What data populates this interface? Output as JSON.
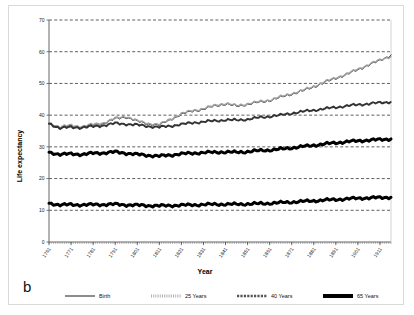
{
  "figure": {
    "panel_letter": "b",
    "frame_color": "#d9d9d9",
    "background": "#ffffff"
  },
  "chart_data": {
    "type": "line",
    "title": "",
    "xlabel": "Year",
    "ylabel": "Life expectancy",
    "xlim": [
      1761,
      1916
    ],
    "ylim": [
      0,
      70
    ],
    "ytick_step": 10,
    "yticks": [
      0,
      10,
      20,
      30,
      40,
      50,
      60,
      70
    ],
    "xticks": [
      1761,
      1771,
      1781,
      1791,
      1801,
      1811,
      1821,
      1831,
      1841,
      1851,
      1861,
      1871,
      1881,
      1891,
      1901,
      1911
    ],
    "grid": "horizontal-dashed",
    "legend_position": "bottom",
    "x": [
      1761,
      1766,
      1771,
      1776,
      1781,
      1786,
      1791,
      1796,
      1801,
      1806,
      1811,
      1816,
      1821,
      1826,
      1831,
      1836,
      1841,
      1846,
      1851,
      1856,
      1861,
      1866,
      1871,
      1876,
      1881,
      1886,
      1891,
      1896,
      1901,
      1906,
      1911,
      1916
    ],
    "series": [
      {
        "name": "Birth",
        "style": "thin-solid",
        "color": "#1a1a1a",
        "width": 1.0,
        "values": [
          37.4,
          36.1,
          36.6,
          36.2,
          36.9,
          37.4,
          38.8,
          39.4,
          38.0,
          37.2,
          36.8,
          38.6,
          40.2,
          41.3,
          41.8,
          42.9,
          43.5,
          42.8,
          43.4,
          44.0,
          44.6,
          45.6,
          46.6,
          47.6,
          48.9,
          50.3,
          51.6,
          52.8,
          54.3,
          55.8,
          57.2,
          59.0
        ],
        "end_value": 59.0
      },
      {
        "name": "25 Years",
        "style": "light-dotted",
        "color": "#9e9e9e",
        "width": 1.6,
        "values": [
          37.6,
          36.3,
          36.8,
          36.4,
          37.1,
          37.6,
          39.0,
          39.6,
          38.2,
          37.4,
          37.0,
          38.8,
          40.4,
          41.5,
          42.0,
          43.1,
          43.7,
          43.0,
          43.6,
          44.2,
          44.8,
          45.8,
          46.8,
          47.8,
          49.1,
          50.5,
          51.8,
          53.0,
          54.5,
          56.0,
          57.4,
          58.6
        ],
        "end_value": 58.6
      },
      {
        "name": "40 Years",
        "style": "medium-dotted",
        "color": "#333333",
        "width": 2.0,
        "values": [
          37.3,
          35.9,
          36.2,
          36.1,
          36.4,
          36.8,
          37.4,
          37.2,
          36.9,
          36.5,
          36.2,
          36.6,
          37.1,
          37.6,
          37.9,
          38.2,
          38.5,
          38.4,
          38.7,
          39.2,
          39.6,
          40.0,
          40.6,
          41.1,
          41.6,
          42.0,
          42.5,
          42.9,
          43.3,
          43.6,
          43.9,
          44.2
        ],
        "end_value": 44.2
      },
      {
        "name": "65 Years",
        "style": "thick-solid",
        "color": "#000000",
        "width": 3.0,
        "values": [
          28.3,
          27.6,
          27.8,
          27.6,
          28.0,
          28.1,
          28.4,
          28.0,
          27.6,
          27.3,
          27.1,
          27.4,
          27.8,
          28.0,
          28.2,
          28.3,
          28.4,
          28.3,
          28.5,
          28.8,
          29.0,
          29.3,
          29.7,
          30.1,
          30.5,
          30.9,
          31.3,
          31.6,
          31.9,
          32.1,
          32.3,
          32.5
        ],
        "end_value": 32.5
      },
      {
        "name": "65 Years (lower)",
        "style": "thick-solid",
        "color": "#000000",
        "width": 3.0,
        "values": [
          12.2,
          11.7,
          11.8,
          11.7,
          11.8,
          11.8,
          11.9,
          11.7,
          11.6,
          11.5,
          11.4,
          11.5,
          11.6,
          11.7,
          11.8,
          11.9,
          11.9,
          11.9,
          12.0,
          12.1,
          12.2,
          12.4,
          12.6,
          12.8,
          13.0,
          13.2,
          13.4,
          13.6,
          13.8,
          13.9,
          14.0,
          14.1
        ],
        "end_value": 14.1
      }
    ],
    "legend": [
      {
        "label": "Birth",
        "style": "thin-solid",
        "color": "#1a1a1a",
        "width": 1.0
      },
      {
        "label": "25 Years",
        "style": "light-dotted",
        "color": "#b0b0b0",
        "width": 3.0
      },
      {
        "label": "40 Years",
        "style": "medium-dotted",
        "color": "#555555",
        "width": 2.5
      },
      {
        "label": "65 Years",
        "style": "thick-solid",
        "color": "#000000",
        "width": 4.0
      }
    ]
  }
}
